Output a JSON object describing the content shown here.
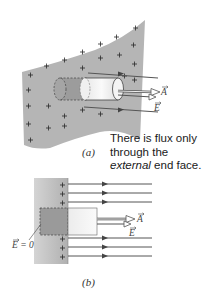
{
  "figure": {
    "panel_a": {
      "label": "(a)",
      "vector_A": "A",
      "vector_E": "E",
      "caption_line1": "There is flux only",
      "caption_line2": "through the",
      "caption_em": "external",
      "caption_line3_rest": " end face."
    },
    "panel_b": {
      "label": "(b)",
      "vector_A": "A",
      "vector_E": "E",
      "e_zero_label": "E = 0"
    },
    "colors": {
      "sheet": "#b8b8b8",
      "field_line": "#555555",
      "cylinder_face": "#f2f2f2",
      "inner_region": "#9a9a9a"
    }
  }
}
